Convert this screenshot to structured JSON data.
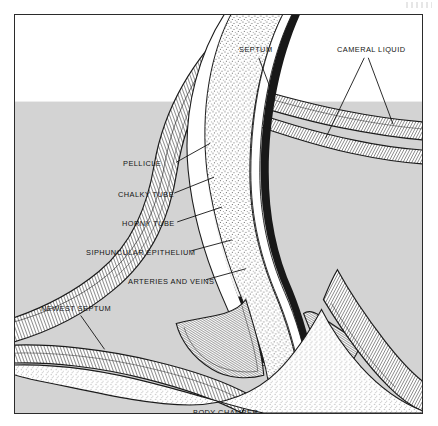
{
  "figure": {
    "background_white": "#ffffff",
    "cameral_gray": "#d3d3d3",
    "ink_color": "#141414",
    "frame_color": "#2b2b2b"
  },
  "labels": {
    "septum": "SEPTUM",
    "cameral_liquid": "CAMERAL LIQUID",
    "pellicle": "PELLICLE",
    "chalky_tube": "CHALKY TUBE",
    "horny_tube": "HORNY TUBE",
    "siphuncular_epithelium": "SIPHUNCULAR EPITHELIUM",
    "arteries_and_veins": "ARTERIES AND VEINS",
    "newest_septum": "NEWEST SEPTUM",
    "body_chamber": "BODY CHAMBER"
  }
}
